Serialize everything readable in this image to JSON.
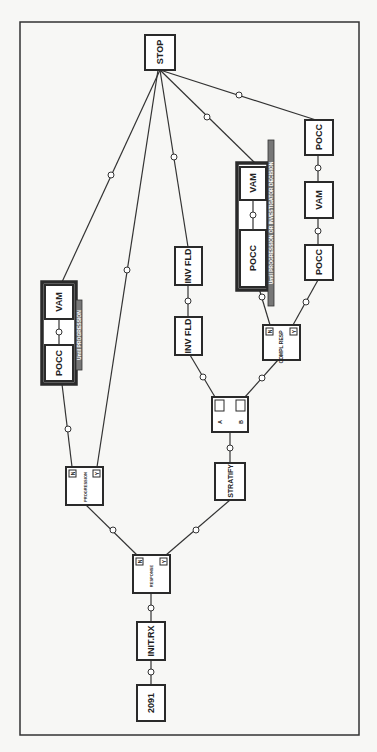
{
  "diagram": {
    "type": "flowchart",
    "orientation": "rotated-90",
    "nodes": {
      "start": {
        "label": "2091"
      },
      "init_rx": {
        "label": "INIT.RX"
      },
      "response": {
        "label": "RESPONSE",
        "no": "N",
        "yes": "Y"
      },
      "progression": {
        "label": "PROGRESSION",
        "no": "N",
        "yes": "Y"
      },
      "stratify": {
        "label": "STRATIFY"
      },
      "randomize": {
        "a": "A",
        "b": "B"
      },
      "inv_fld_1": {
        "label": "INV FLD"
      },
      "inv_fld_2": {
        "label": "INV FLD"
      },
      "compl_resp": {
        "label": "COMPL RESP",
        "no": "N",
        "yes": "Y"
      },
      "left_pocc": {
        "label": "POCC"
      },
      "left_vam": {
        "label": "VAM"
      },
      "mid_pocc": {
        "label": "POCC"
      },
      "mid_vam": {
        "label": "VAM"
      },
      "right_pocc_1": {
        "label": "POCC"
      },
      "right_vam": {
        "label": "VAM"
      },
      "right_pocc_2": {
        "label": "POCC"
      },
      "stop": {
        "label": "STOP"
      }
    },
    "brackets": {
      "left": {
        "label": "Until PROGRESSION"
      },
      "mid": {
        "label": "Until PROGRESSION OR INVESTIGATOR DECISION"
      }
    },
    "connector_symbol": "⊕"
  }
}
